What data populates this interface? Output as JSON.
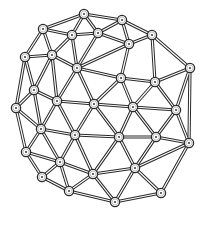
{
  "diagram": {
    "type": "mesh-network",
    "width": 209,
    "height": 225,
    "colors": {
      "background": "#ffffff",
      "stroke": "#2a2a2a",
      "fill": "#ffffff",
      "center_dot": "#222222"
    },
    "nodes": [
      {
        "id": 0,
        "x": 84,
        "y": 14
      },
      {
        "id": 1,
        "x": 122,
        "y": 20
      },
      {
        "id": 2,
        "x": 43,
        "y": 29
      },
      {
        "id": 3,
        "x": 72,
        "y": 35
      },
      {
        "id": 4,
        "x": 98,
        "y": 33
      },
      {
        "id": 5,
        "x": 152,
        "y": 35
      },
      {
        "id": 6,
        "x": 129,
        "y": 44
      },
      {
        "id": 7,
        "x": 52,
        "y": 55
      },
      {
        "id": 8,
        "x": 25,
        "y": 57
      },
      {
        "id": 9,
        "x": 77,
        "y": 68
      },
      {
        "id": 10,
        "x": 190,
        "y": 68
      },
      {
        "id": 11,
        "x": 121,
        "y": 78
      },
      {
        "id": 12,
        "x": 155,
        "y": 82
      },
      {
        "id": 13,
        "x": 34,
        "y": 90
      },
      {
        "id": 14,
        "x": 57,
        "y": 101
      },
      {
        "id": 15,
        "x": 94,
        "y": 104
      },
      {
        "id": 16,
        "x": 133,
        "y": 107
      },
      {
        "id": 17,
        "x": 16,
        "y": 108
      },
      {
        "id": 18,
        "x": 176,
        "y": 110
      },
      {
        "id": 19,
        "x": 41,
        "y": 129
      },
      {
        "id": 20,
        "x": 75,
        "y": 135
      },
      {
        "id": 21,
        "x": 119,
        "y": 137
      },
      {
        "id": 22,
        "x": 156,
        "y": 137
      },
      {
        "id": 23,
        "x": 189,
        "y": 143
      },
      {
        "id": 24,
        "x": 26,
        "y": 152
      },
      {
        "id": 25,
        "x": 60,
        "y": 162
      },
      {
        "id": 26,
        "x": 135,
        "y": 168
      },
      {
        "id": 27,
        "x": 93,
        "y": 174
      },
      {
        "id": 28,
        "x": 42,
        "y": 177
      },
      {
        "id": 29,
        "x": 69,
        "y": 191
      },
      {
        "id": 30,
        "x": 161,
        "y": 193
      },
      {
        "id": 31,
        "x": 115,
        "y": 202
      }
    ],
    "edges": [
      [
        0,
        1
      ],
      [
        0,
        2
      ],
      [
        0,
        3
      ],
      [
        0,
        4
      ],
      [
        1,
        4
      ],
      [
        1,
        5
      ],
      [
        1,
        6
      ],
      [
        4,
        6
      ],
      [
        3,
        4
      ],
      [
        2,
        3
      ],
      [
        2,
        7
      ],
      [
        2,
        8
      ],
      [
        3,
        7
      ],
      [
        3,
        9
      ],
      [
        4,
        9
      ],
      [
        6,
        9
      ],
      [
        6,
        11
      ],
      [
        5,
        6
      ],
      [
        5,
        12
      ],
      [
        5,
        10
      ],
      [
        7,
        8
      ],
      [
        7,
        9
      ],
      [
        7,
        13
      ],
      [
        7,
        14
      ],
      [
        8,
        13
      ],
      [
        8,
        17
      ],
      [
        9,
        14
      ],
      [
        9,
        15
      ],
      [
        9,
        11
      ],
      [
        11,
        15
      ],
      [
        11,
        16
      ],
      [
        11,
        12
      ],
      [
        12,
        16
      ],
      [
        12,
        10
      ],
      [
        12,
        18
      ],
      [
        10,
        18
      ],
      [
        10,
        23
      ],
      [
        13,
        14
      ],
      [
        13,
        17
      ],
      [
        13,
        19
      ],
      [
        14,
        15
      ],
      [
        14,
        19
      ],
      [
        14,
        20
      ],
      [
        15,
        16
      ],
      [
        15,
        20
      ],
      [
        15,
        21
      ],
      [
        16,
        21
      ],
      [
        16,
        22
      ],
      [
        16,
        18
      ],
      [
        18,
        22
      ],
      [
        18,
        23
      ],
      [
        17,
        19
      ],
      [
        17,
        24
      ],
      [
        19,
        20
      ],
      [
        19,
        24
      ],
      [
        19,
        25
      ],
      [
        20,
        21
      ],
      [
        20,
        25
      ],
      [
        20,
        27
      ],
      [
        21,
        22
      ],
      [
        21,
        26
      ],
      [
        21,
        27
      ],
      [
        22,
        23
      ],
      [
        22,
        26
      ],
      [
        23,
        26
      ],
      [
        23,
        30
      ],
      [
        24,
        25
      ],
      [
        24,
        28
      ],
      [
        25,
        28
      ],
      [
        25,
        29
      ],
      [
        25,
        27
      ],
      [
        27,
        29
      ],
      [
        27,
        26
      ],
      [
        27,
        31
      ],
      [
        26,
        31
      ],
      [
        26,
        30
      ],
      [
        28,
        29
      ],
      [
        29,
        31
      ],
      [
        30,
        31
      ]
    ],
    "node_radius": 4.6
  }
}
